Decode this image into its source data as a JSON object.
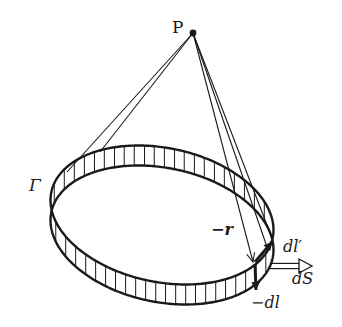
{
  "diagram": {
    "colors": {
      "ink": "#1a1a1a",
      "background": "#ffffff"
    },
    "point": {
      "label": "P",
      "x": 193,
      "y": 33
    },
    "loop": {
      "label": "Γ",
      "center": [
        162,
        215
      ],
      "semi_major": 113,
      "semi_minor": 67,
      "rotation_deg": 11.7,
      "band_height": 20,
      "hatch_spacing": 10
    },
    "lines_from_p": [
      {
        "to": [
          67,
          172
        ]
      },
      {
        "to": [
          100,
          152
        ]
      },
      {
        "to": [
          266,
          244
        ]
      },
      {
        "to": [
          272,
          238
        ]
      }
    ],
    "vector_r": {
      "label": "−r",
      "from": [
        193,
        33
      ],
      "to": [
        253,
        262
      ]
    },
    "vector_dl_prime": {
      "label": "dl′",
      "from": [
        255,
        262
      ],
      "to": [
        272,
        242
      ]
    },
    "vector_minus_dl": {
      "label": "−dl",
      "from": [
        255,
        264
      ],
      "to": [
        256,
        290
      ]
    },
    "vector_ds": {
      "label": "dS",
      "from": [
        270,
        266
      ],
      "to": [
        312,
        266
      ]
    },
    "labels": {
      "P": "P",
      "gamma": "Γ",
      "minus_r": "−r",
      "dl_prime": "dl′",
      "ds": "dS",
      "minus_dl": "−dl"
    }
  }
}
